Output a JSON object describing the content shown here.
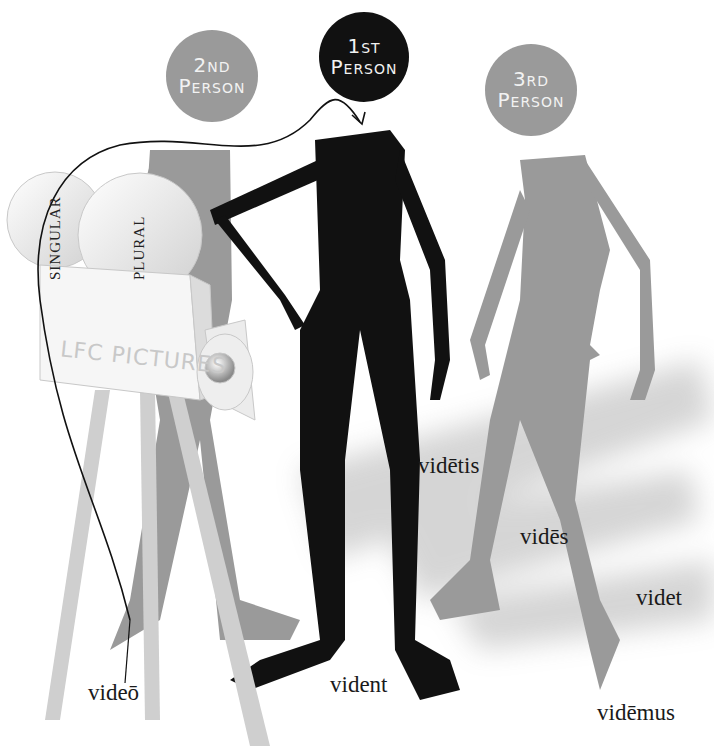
{
  "persons": {
    "second": {
      "line1": "2nd",
      "line2": "Person",
      "color": "#9a9a9a"
    },
    "first": {
      "line1": "1st",
      "line2": "Person",
      "color": "#111111"
    },
    "third": {
      "line1": "3rd",
      "line2": "Person",
      "color": "#9a9a9a"
    }
  },
  "camera": {
    "reel_left_label": "SINGULAR",
    "reel_right_label": "PLURAL",
    "brand": "LFC PICTURES"
  },
  "forms": {
    "first_singular": "videō",
    "second_singular": "vidēs",
    "third_singular": "videt",
    "first_plural": "vidēmus",
    "second_plural": "vidētis",
    "third_plural": "vident"
  },
  "colors": {
    "black_figure": "#111111",
    "grey_figure": "#999999",
    "camera": "#e6e6e6"
  }
}
